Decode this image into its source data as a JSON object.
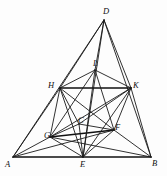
{
  "figure": {
    "kind": "geometry-diagram",
    "background_color": "#fdfdfd",
    "line_color": "#1b1b1b",
    "label_color": "#0f0f0f",
    "width": 167,
    "height": 176
  },
  "points": [
    {
      "id": "A",
      "label": "A",
      "x": 13,
      "y": 157,
      "label_x": 5,
      "label_y": 160
    },
    {
      "id": "B",
      "label": "B",
      "x": 151,
      "y": 157,
      "label_x": 152,
      "label_y": 159
    },
    {
      "id": "D",
      "label": "D",
      "x": 104,
      "y": 20,
      "label_x": 103,
      "label_y": 7
    },
    {
      "id": "E",
      "label": "E",
      "x": 83,
      "y": 157,
      "label_x": 80,
      "label_y": 160
    },
    {
      "id": "H",
      "label": "H",
      "x": 60,
      "y": 88,
      "label_x": 48,
      "label_y": 81
    },
    {
      "id": "K",
      "label": "K",
      "x": 131,
      "y": 88,
      "label_x": 133,
      "label_y": 81
    },
    {
      "id": "L",
      "label": "L",
      "x": 95,
      "y": 70,
      "label_x": 93,
      "label_y": 59
    },
    {
      "id": "C",
      "label": "C",
      "x": 79,
      "y": 124,
      "label_x": 78,
      "label_y": 116
    },
    {
      "id": "G",
      "label": "G",
      "x": 50,
      "y": 137,
      "label_x": 44,
      "label_y": 131
    },
    {
      "id": "F",
      "label": "F",
      "x": 114,
      "y": 130,
      "label_x": 115,
      "label_y": 123
    }
  ],
  "segments": [
    {
      "from": "A",
      "to": "B",
      "weight": "strong"
    },
    {
      "from": "A",
      "to": "D",
      "weight": "normal"
    },
    {
      "from": "B",
      "to": "D",
      "weight": "normal"
    },
    {
      "from": "H",
      "to": "K",
      "weight": "strong"
    },
    {
      "from": "G",
      "to": "F",
      "weight": "strong"
    },
    {
      "from": "D",
      "to": "H",
      "weight": "normal"
    },
    {
      "from": "D",
      "to": "K",
      "weight": "normal"
    },
    {
      "from": "D",
      "to": "L",
      "weight": "normal"
    },
    {
      "from": "D",
      "to": "E",
      "weight": "normal"
    },
    {
      "from": "H",
      "to": "L",
      "weight": "normal"
    },
    {
      "from": "K",
      "to": "L",
      "weight": "normal"
    },
    {
      "from": "A",
      "to": "H",
      "weight": "normal"
    },
    {
      "from": "B",
      "to": "K",
      "weight": "normal"
    },
    {
      "from": "A",
      "to": "G",
      "weight": "normal"
    },
    {
      "from": "B",
      "to": "F",
      "weight": "normal"
    },
    {
      "from": "A",
      "to": "F",
      "weight": "normal"
    },
    {
      "from": "B",
      "to": "G",
      "weight": "normal"
    },
    {
      "from": "H",
      "to": "G",
      "weight": "normal"
    },
    {
      "from": "H",
      "to": "C",
      "weight": "normal"
    },
    {
      "from": "H",
      "to": "E",
      "weight": "normal"
    },
    {
      "from": "K",
      "to": "F",
      "weight": "normal"
    },
    {
      "from": "K",
      "to": "C",
      "weight": "normal"
    },
    {
      "from": "K",
      "to": "E",
      "weight": "normal"
    },
    {
      "from": "G",
      "to": "C",
      "weight": "normal"
    },
    {
      "from": "G",
      "to": "E",
      "weight": "normal"
    },
    {
      "from": "C",
      "to": "F",
      "weight": "normal"
    },
    {
      "from": "E",
      "to": "F",
      "weight": "normal"
    },
    {
      "from": "C",
      "to": "E",
      "weight": "normal"
    },
    {
      "from": "L",
      "to": "E",
      "weight": "normal"
    },
    {
      "from": "L",
      "to": "G",
      "weight": "normal"
    },
    {
      "from": "L",
      "to": "F",
      "weight": "normal"
    },
    {
      "from": "H",
      "to": "F",
      "weight": "normal"
    },
    {
      "from": "K",
      "to": "G",
      "weight": "normal"
    }
  ]
}
